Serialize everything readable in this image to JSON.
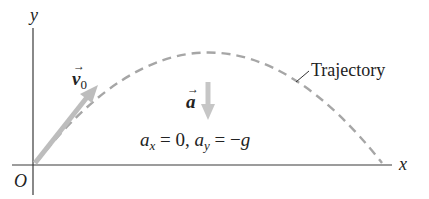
{
  "diagram": {
    "axes": {
      "x_label": "x",
      "y_label": "y",
      "origin_label": "O"
    },
    "trajectory": {
      "label": "Trajectory",
      "style": "dashed",
      "color": "#a6a6a6"
    },
    "initial_velocity": {
      "symbol": "v",
      "subscript": "0",
      "color": "#bdbdbd"
    },
    "acceleration": {
      "symbol": "a",
      "color": "#bdbdbd"
    },
    "equation": {
      "ax_symbol": "a",
      "ax_sub": "x",
      "ax_eq": " = 0, ",
      "ay_symbol": "a",
      "ay_sub": "y",
      "ay_eq": " = −",
      "g": "g"
    },
    "colors": {
      "axis": "#3a3a3a",
      "text": "#222222"
    }
  }
}
